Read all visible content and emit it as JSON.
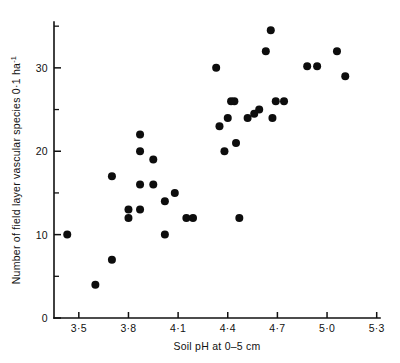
{
  "chart_data": {
    "type": "scatter",
    "title": "",
    "xlabel": "Soil pH at 0–5 cm",
    "ylabel": "Number of field layer vascular species 0·1 ha⁻¹",
    "ylabel_main": "Number of field layer vascular species 0·1 ha",
    "ylabel_exponent": "-1",
    "xlim": [
      3.35,
      5.32
    ],
    "ylim": [
      0,
      35.5
    ],
    "grid": false,
    "legend": null,
    "xticks": [
      3.5,
      3.8,
      4.1,
      4.4,
      4.7,
      5.0,
      5.3
    ],
    "xticklabels": [
      "3·5",
      "3·8",
      "4·1",
      "4·4",
      "4·7",
      "5·0",
      "5·3"
    ],
    "yticks": [
      0,
      10,
      20,
      30
    ],
    "yticklabels": [
      "0",
      "10",
      "20",
      "30"
    ],
    "yticks_minor": [
      5,
      15,
      25,
      35
    ],
    "marker": "filled-circle",
    "marker_color": "#0d0d0d",
    "marker_size": 5.2,
    "n_points": 37,
    "points": [
      {
        "x": 3.43,
        "y": 10
      },
      {
        "x": 3.6,
        "y": 4
      },
      {
        "x": 3.7,
        "y": 7
      },
      {
        "x": 3.7,
        "y": 17
      },
      {
        "x": 3.8,
        "y": 13
      },
      {
        "x": 3.8,
        "y": 12
      },
      {
        "x": 3.87,
        "y": 22
      },
      {
        "x": 3.87,
        "y": 20
      },
      {
        "x": 3.87,
        "y": 16
      },
      {
        "x": 3.87,
        "y": 13
      },
      {
        "x": 3.95,
        "y": 19
      },
      {
        "x": 3.95,
        "y": 16
      },
      {
        "x": 4.02,
        "y": 14
      },
      {
        "x": 4.02,
        "y": 10
      },
      {
        "x": 4.08,
        "y": 15
      },
      {
        "x": 4.15,
        "y": 12
      },
      {
        "x": 4.19,
        "y": 12
      },
      {
        "x": 4.33,
        "y": 30
      },
      {
        "x": 4.35,
        "y": 23
      },
      {
        "x": 4.38,
        "y": 20
      },
      {
        "x": 4.4,
        "y": 24
      },
      {
        "x": 4.44,
        "y": 26
      },
      {
        "x": 4.45,
        "y": 21
      },
      {
        "x": 4.47,
        "y": 12
      },
      {
        "x": 4.52,
        "y": 24
      },
      {
        "x": 4.59,
        "y": 25
      },
      {
        "x": 4.63,
        "y": 32
      },
      {
        "x": 4.66,
        "y": 34.5
      },
      {
        "x": 4.67,
        "y": 24
      },
      {
        "x": 4.69,
        "y": 26
      },
      {
        "x": 4.74,
        "y": 26
      },
      {
        "x": 4.88,
        "y": 30.2
      },
      {
        "x": 4.94,
        "y": 30.2
      },
      {
        "x": 5.06,
        "y": 32
      },
      {
        "x": 5.11,
        "y": 29
      },
      {
        "x": 4.42,
        "y": 26
      },
      {
        "x": 4.56,
        "y": 24.5
      }
    ]
  }
}
